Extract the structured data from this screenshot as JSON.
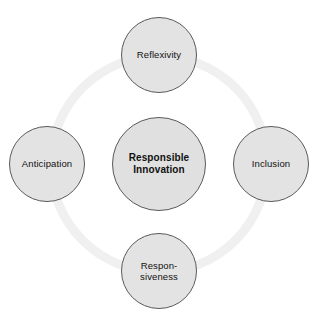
{
  "diagram": {
    "type": "circular-hub-and-spoke",
    "background_color": "#ffffff",
    "ring": {
      "name": "connecting-ring",
      "color": "#f0f0f0",
      "stroke_width": 9,
      "radius": 108,
      "center_x": 159,
      "center_y": 164
    },
    "node_style": {
      "fill_color": "#e3e3e3",
      "border_color": "#5a5a5a",
      "text_color": "#111111"
    },
    "center": {
      "id": "responsible-innovation",
      "label": "Responsible\nInnovation",
      "bold": true,
      "diameter": 94
    },
    "nodes": [
      {
        "id": "reflexivity",
        "label": "Reflexivity",
        "position": "top",
        "diameter": 76
      },
      {
        "id": "anticipation",
        "label": "Anticipation",
        "position": "left",
        "diameter": 76
      },
      {
        "id": "inclusion",
        "label": "Inclusion",
        "position": "right",
        "diameter": 76
      },
      {
        "id": "responsiveness",
        "label": "Respon-\nsiveness",
        "position": "bottom",
        "diameter": 76
      }
    ]
  }
}
